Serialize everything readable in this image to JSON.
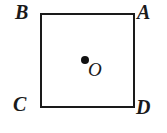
{
  "figure": {
    "shape": "square",
    "background_color": "#ffffff",
    "stroke_color": "#1a1a1a",
    "stroke_width_px": 2,
    "labels": {
      "top_left": "B",
      "top_right": "A",
      "bottom_left": "C",
      "bottom_right": "D",
      "center": "O"
    },
    "center_point": {
      "marker": "filled-dot",
      "color": "#111111"
    }
  }
}
